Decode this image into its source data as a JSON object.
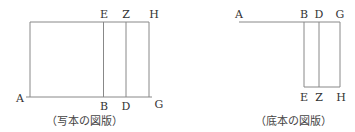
{
  "figures": [
    {
      "id": "manuscript",
      "caption": "（写本の図版）",
      "labels": {
        "A": "A",
        "B": "B",
        "D": "D",
        "G": "G",
        "E": "E",
        "Z": "Z",
        "H": "H"
      }
    },
    {
      "id": "base-text",
      "caption": "（底本の図版）",
      "labels": {
        "A": "A",
        "B": "B",
        "D": "D",
        "G": "G",
        "E": "E",
        "Z": "Z",
        "H": "H"
      }
    }
  ],
  "colors": {
    "line": "#777777",
    "text": "#333333"
  }
}
